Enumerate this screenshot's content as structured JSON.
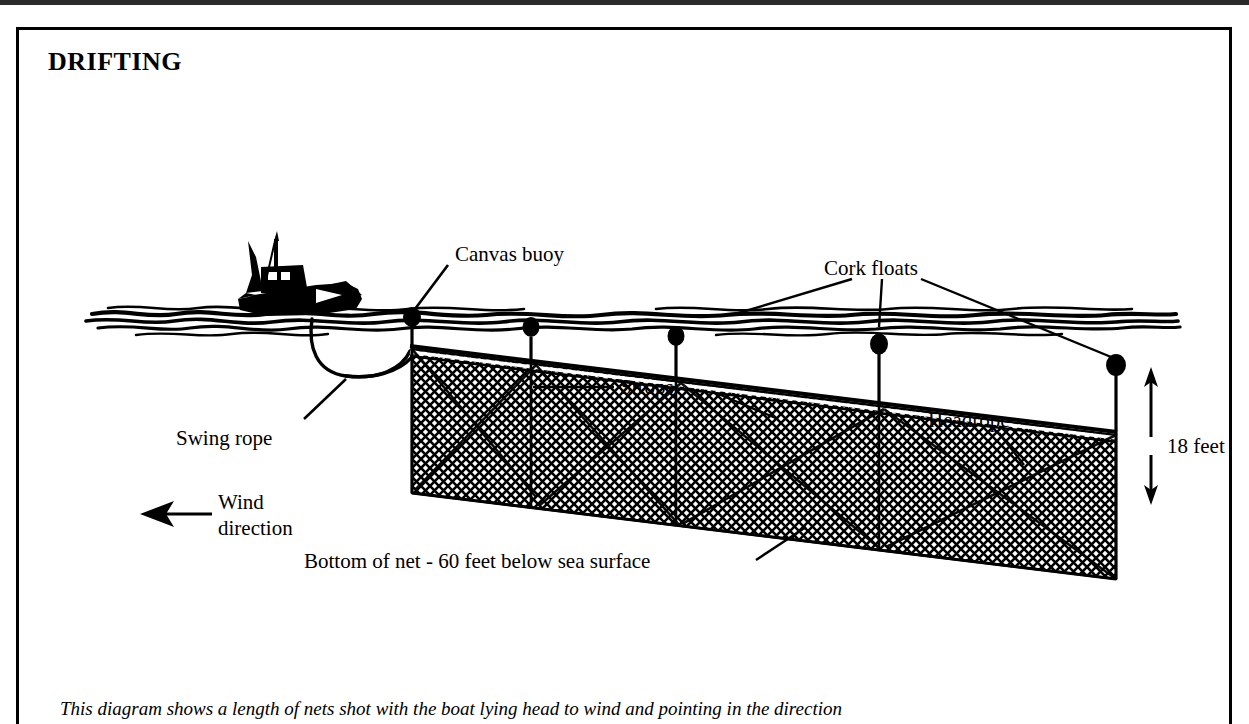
{
  "title": "DRIFTING",
  "caption": "This diagram shows a length of nets shot with the boat lying head to wind and pointing in the direction",
  "labels": {
    "canvas_buoy": "Canvas buoy",
    "cork_floats": "Cork floats",
    "swing_rope": "Swing rope",
    "strops": "Strops",
    "headrope": "Headrope",
    "depth_mark": "18 feet",
    "wind_line1": "Wind",
    "wind_line2": "direction",
    "net_bottom": "Bottom of net - 60 feet below sea surface"
  },
  "diagram": {
    "type": "technical-illustration",
    "colors": {
      "ink": "#000000",
      "paper": "#ffffff"
    },
    "measurements": [
      {
        "name": "headrope depth below surface",
        "value": 18,
        "unit": "feet"
      },
      {
        "name": "net bottom depth below sea surface",
        "value": 60,
        "unit": "feet"
      }
    ],
    "elements": [
      "boat-silhouette",
      "sea-surface",
      "canvas-buoy",
      "cork-floats",
      "strops",
      "swing-rope",
      "headrope",
      "net-mesh",
      "wind-arrow",
      "depth-arrow"
    ],
    "cork_float_positions_x": [
      411,
      530,
      675,
      878,
      1116
    ],
    "wind_direction": "left"
  }
}
